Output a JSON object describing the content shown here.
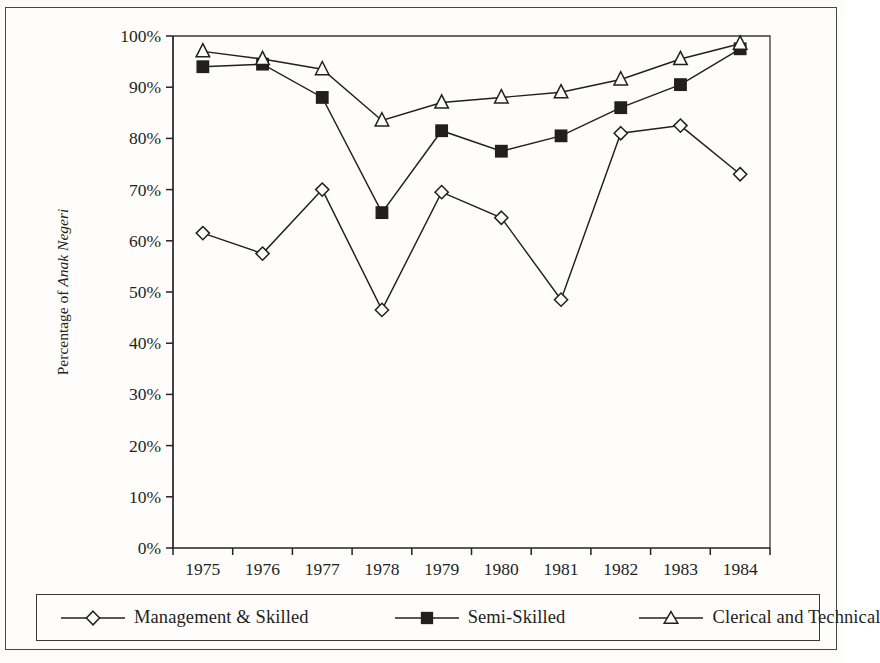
{
  "chart_data": {
    "type": "line",
    "title": "",
    "xlabel": "",
    "ylabel": "Percentage of Anak Negeri",
    "ylabel_plain": "Percentage of ",
    "ylabel_italic": "Anak Negeri",
    "categories": [
      "1975",
      "1976",
      "1977",
      "1978",
      "1979",
      "1980",
      "1981",
      "1982",
      "1983",
      "1984"
    ],
    "ytick_labels": [
      "0%",
      "10%",
      "20%",
      "30%",
      "40%",
      "50%",
      "60%",
      "70%",
      "80%",
      "90%",
      "100%"
    ],
    "ytick_values": [
      0,
      10,
      20,
      30,
      40,
      50,
      60,
      70,
      80,
      90,
      100
    ],
    "ylim": [
      0,
      100
    ],
    "grid": false,
    "legend_position": "bottom",
    "series": [
      {
        "name": "Management & Skilled",
        "marker": "open-diamond",
        "color": "#231f1c",
        "values": [
          61.5,
          57.5,
          70.0,
          46.5,
          69.5,
          64.5,
          48.5,
          81.0,
          82.5,
          73.0
        ]
      },
      {
        "name": "Semi-Skilled",
        "marker": "filled-square",
        "color": "#231f1c",
        "values": [
          94.0,
          94.5,
          88.0,
          65.5,
          81.5,
          77.5,
          80.5,
          86.0,
          90.5,
          97.5
        ]
      },
      {
        "name": "Clerical and Technical",
        "marker": "open-triangle",
        "color": "#231f1c",
        "values": [
          97.0,
          95.5,
          93.5,
          83.5,
          87.0,
          88.0,
          89.0,
          91.5,
          95.5,
          98.5
        ]
      }
    ]
  },
  "legend": {
    "entries": [
      {
        "label": "Management & Skilled",
        "marker": "open-diamond"
      },
      {
        "label": "Semi-Skilled",
        "marker": "filled-square"
      },
      {
        "label": "Clerical and Technical",
        "marker": "open-triangle"
      }
    ]
  }
}
